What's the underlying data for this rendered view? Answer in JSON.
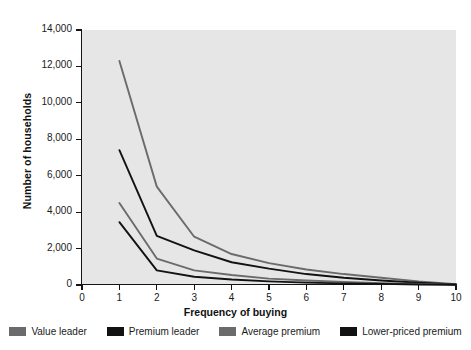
{
  "chart_data": {
    "type": "line",
    "title": "",
    "xlabel": "Frequency of buying",
    "ylabel": "Number of households",
    "x": [
      1,
      2,
      3,
      4,
      5,
      6,
      7,
      8,
      9,
      10
    ],
    "xlim": [
      0,
      10
    ],
    "ylim": [
      0,
      14000
    ],
    "xticks": [
      "0",
      "1",
      "2",
      "3",
      "4",
      "5",
      "6",
      "7",
      "8",
      "9",
      "10"
    ],
    "yticks": [
      "0",
      "2,000",
      "4,000",
      "6,000",
      "8,000",
      "10,000",
      "12,000",
      "14,000"
    ],
    "grid": false,
    "legend_position": "bottom",
    "plot_background": "#e6e6e6",
    "series": [
      {
        "name": "Value leader",
        "color": "#6b6b6b",
        "values": [
          12300,
          5400,
          2650,
          1700,
          1200,
          850,
          600,
          400,
          200,
          50
        ]
      },
      {
        "name": "Premium leader",
        "color": "#121212",
        "values": [
          7400,
          2700,
          1900,
          1250,
          900,
          600,
          400,
          250,
          120,
          30
        ]
      },
      {
        "name": "Average premium",
        "color": "#6b6b6b",
        "values": [
          4500,
          1450,
          800,
          550,
          350,
          250,
          170,
          100,
          60,
          20
        ]
      },
      {
        "name": "Lower-priced premium",
        "color": "#121212",
        "values": [
          3450,
          800,
          450,
          300,
          200,
          130,
          90,
          60,
          30,
          10
        ]
      }
    ]
  },
  "axis": {
    "y_title": "Number of households",
    "x_title": "Frequency of buying"
  },
  "legend": {
    "items": [
      {
        "label": "Value leader",
        "color": "#6b6b6b"
      },
      {
        "label": "Premium leader",
        "color": "#121212"
      },
      {
        "label": "Average premium",
        "color": "#6b6b6b"
      },
      {
        "label": "Lower-priced premium",
        "color": "#121212"
      }
    ]
  }
}
